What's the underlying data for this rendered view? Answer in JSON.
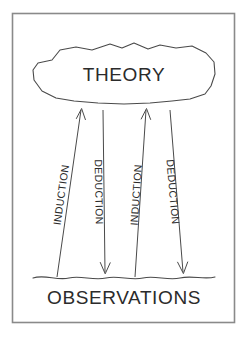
{
  "figure": {
    "type": "diagram",
    "background_color": "#ffffff",
    "border_color": "#8a8a8a",
    "ink_color": "#4a4a4a",
    "text_color": "#2b2b2b"
  },
  "nodes": {
    "theory": {
      "label": "THEORY",
      "shape": "cloud",
      "position": "top"
    },
    "observations": {
      "label": "OBSERVATIONS",
      "shape": "ground-line",
      "position": "bottom"
    }
  },
  "edges": [
    {
      "label": "INDUCTION",
      "direction": "up",
      "from": "observations",
      "to": "theory",
      "text_orientation": "bottom-to-top"
    },
    {
      "label": "DEDUCTION",
      "direction": "down",
      "from": "theory",
      "to": "observations",
      "text_orientation": "top-to-bottom"
    },
    {
      "label": "INDUCTION",
      "direction": "up",
      "from": "observations",
      "to": "theory",
      "text_orientation": "bottom-to-top"
    },
    {
      "label": "DEDUCTION",
      "direction": "down",
      "from": "theory",
      "to": "observations",
      "text_orientation": "top-to-bottom"
    }
  ]
}
